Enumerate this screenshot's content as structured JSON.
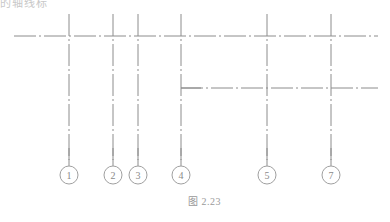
{
  "header": {
    "cut_text": "的轴线标"
  },
  "figure": {
    "caption": "图 2.23",
    "line_color": "#8c8c8c",
    "label_color": "#8a8a8a",
    "horizontal_axes": [
      {
        "y": 36,
        "x1": 14,
        "x2": 378
      },
      {
        "y": 88,
        "x1": 181,
        "x2": 378
      }
    ],
    "vertical_axes": [
      {
        "label": "1",
        "x": 69
      },
      {
        "label": "2",
        "x": 113
      },
      {
        "label": "3",
        "x": 138
      },
      {
        "label": "4",
        "x": 181
      },
      {
        "label": "5",
        "x": 267
      },
      {
        "label": "7",
        "x": 331
      }
    ]
  }
}
